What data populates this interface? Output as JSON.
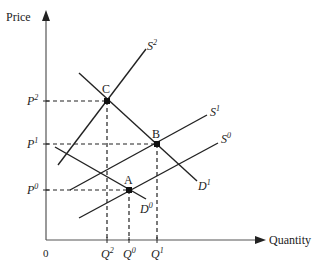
{
  "diagram": {
    "type": "supply-demand",
    "axes": {
      "y_label": "Price",
      "x_label": "Quantity",
      "origin_label": "0"
    },
    "price_levels": [
      {
        "base": "P",
        "sup": "2",
        "y": 101
      },
      {
        "base": "P",
        "sup": "1",
        "y": 144
      },
      {
        "base": "P",
        "sup": "0",
        "y": 190
      }
    ],
    "quantity_levels": [
      {
        "base": "Q",
        "sup": "2",
        "x": 107
      },
      {
        "base": "Q",
        "sup": "0",
        "x": 129
      },
      {
        "base": "Q",
        "sup": "1",
        "x": 157
      }
    ],
    "points": [
      {
        "label": "C",
        "x": 107,
        "y": 101
      },
      {
        "label": "B",
        "x": 157,
        "y": 144
      },
      {
        "label": "A",
        "x": 129,
        "y": 190
      }
    ],
    "curves": [
      {
        "name": "S",
        "sup": "2",
        "kind": "supply"
      },
      {
        "name": "S",
        "sup": "1",
        "kind": "supply"
      },
      {
        "name": "S",
        "sup": "0",
        "kind": "supply"
      },
      {
        "name": "D",
        "sup": "1",
        "kind": "demand"
      },
      {
        "name": "D",
        "sup": "0",
        "kind": "demand"
      }
    ],
    "colors": {
      "line": "#222222",
      "axis": "#555555"
    }
  }
}
